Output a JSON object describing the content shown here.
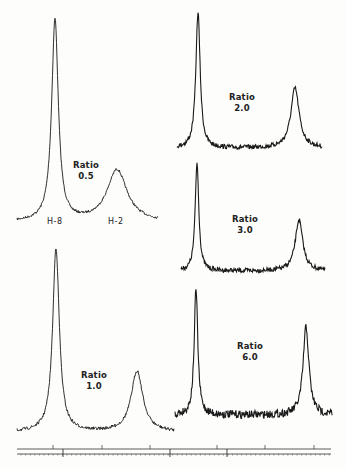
{
  "chart_data": {
    "type": "line",
    "title": "",
    "xlabel": "",
    "ylabel": "",
    "grid": false,
    "legend": "none",
    "peak_labels": [
      "H-8",
      "H-2"
    ],
    "spectra": [
      {
        "id": "A",
        "label": "Ratio",
        "value": "0.5",
        "x_range": [
          17,
          158
        ],
        "baseline_y": 222,
        "peaks": [
          {
            "name": "H-8",
            "x": 55,
            "top_y": 20,
            "width": 4
          },
          {
            "name": "H-2",
            "x": 117,
            "top_y": 170,
            "width": 12
          }
        ],
        "noise": 1.2
      },
      {
        "id": "B",
        "label": "Ratio",
        "value": "2.0",
        "x_range": [
          177,
          322
        ],
        "baseline_y": 148,
        "peaks": [
          {
            "name": "H-8",
            "x": 198,
            "top_y": 12,
            "width": 2.6
          },
          {
            "name": "H-2",
            "x": 295,
            "top_y": 88,
            "width": 5
          }
        ],
        "noise": 2.2
      },
      {
        "id": "C",
        "label": "Ratio",
        "value": "3.0",
        "x_range": [
          181,
          325
        ],
        "baseline_y": 271,
        "peaks": [
          {
            "name": "H-8",
            "x": 197,
            "top_y": 163,
            "width": 2.2
          },
          {
            "name": "H-2",
            "x": 299,
            "top_y": 220,
            "width": 4.5
          }
        ],
        "noise": 2.2
      },
      {
        "id": "D",
        "label": "Ratio",
        "value": "1.0",
        "x_range": [
          17,
          174
        ],
        "baseline_y": 432,
        "peaks": [
          {
            "name": "H-8",
            "x": 56,
            "top_y": 248,
            "width": 4
          },
          {
            "name": "H-2",
            "x": 137,
            "top_y": 371,
            "width": 7
          }
        ],
        "noise": 1.6
      },
      {
        "id": "E",
        "label": "Ratio",
        "value": "6.0",
        "x_range": [
          175,
          332
        ],
        "baseline_y": 415,
        "peaks": [
          {
            "name": "H-8",
            "x": 196,
            "top_y": 289,
            "width": 2.2
          },
          {
            "name": "H-2",
            "x": 306,
            "top_y": 327,
            "width": 3.5
          }
        ],
        "noise": 4
      }
    ],
    "axis": {
      "y_top": 449,
      "y_bottom": 454,
      "x_start": 17,
      "x_end": 331,
      "major_ticks_top": [
        53,
        102,
        150,
        217,
        265,
        314
      ],
      "major_ticks_bottom": [
        63,
        170,
        227
      ]
    }
  },
  "labels": {
    "A": {
      "line1": "Ratio",
      "line2": "0.5"
    },
    "B": {
      "line1": "Ratio",
      "line2": "2.0"
    },
    "C": {
      "line1": "Ratio",
      "line2": "3.0"
    },
    "D": {
      "line1": "Ratio",
      "line2": "1.0"
    },
    "E": {
      "line1": "Ratio",
      "line2": "6.0"
    },
    "h8": "H-8",
    "h2": "H-2"
  }
}
